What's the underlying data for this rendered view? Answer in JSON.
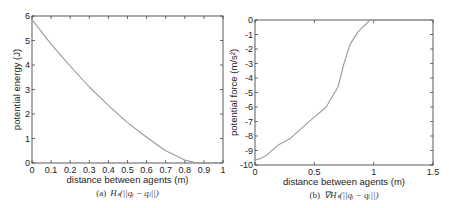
{
  "chart_data": [
    {
      "type": "line",
      "caption": "(a) H_s(||q_i − q_j||)",
      "caption_label": "(a)",
      "caption_math": "Hₛ(||qᵢ − qⱼ||)",
      "title": "",
      "xlabel": "distance between agents (m)",
      "ylabel": "potential energy (J)",
      "xlim": [
        0,
        1
      ],
      "ylim": [
        0,
        6
      ],
      "xticks": [
        "0",
        "0.1",
        "0.2",
        "0.3",
        "0.4",
        "0.5",
        "0.6",
        "0.7",
        "0.8",
        "0.9",
        "1"
      ],
      "yticks": [
        "0",
        "1",
        "2",
        "3",
        "4",
        "5",
        "6"
      ],
      "grid": false,
      "series": [
        {
          "name": "H_s",
          "color": "#9a9a9a",
          "x": [
            0,
            0.1,
            0.2,
            0.3,
            0.4,
            0.5,
            0.6,
            0.7,
            0.8,
            0.85,
            0.88,
            1.0
          ],
          "y": [
            5.85,
            4.85,
            3.95,
            3.1,
            2.35,
            1.65,
            1.05,
            0.5,
            0.12,
            0.03,
            0.0,
            0.0
          ]
        }
      ]
    },
    {
      "type": "line",
      "caption": "(b) ∇H_s(||q_i − q_j||)",
      "caption_label": "(b)",
      "caption_math": "∇Hₛ(||qᵢ − qⱼ||)",
      "title": "",
      "xlabel": "distance between agents (m)",
      "ylabel": "potential force (m/s²)",
      "xlim": [
        0,
        1.5
      ],
      "ylim": [
        -10,
        0
      ],
      "xticks": [
        "0",
        "0.5",
        "1",
        "1.5"
      ],
      "yticks": [
        "0",
        "-1",
        "-2",
        "-3",
        "-4",
        "-5",
        "-6",
        "-7",
        "-8",
        "-9",
        "-10"
      ],
      "grid": false,
      "series": [
        {
          "name": "grad H_s",
          "color": "#9a9a9a",
          "x": [
            0,
            0.05,
            0.1,
            0.2,
            0.3,
            0.4,
            0.5,
            0.6,
            0.7,
            0.75,
            0.8,
            0.87,
            0.97,
            1.5
          ],
          "y": [
            -9.65,
            -9.55,
            -9.3,
            -8.6,
            -8.15,
            -7.4,
            -6.7,
            -6.0,
            -4.6,
            -3.0,
            -1.7,
            -0.8,
            0.0,
            0.0
          ]
        }
      ]
    }
  ]
}
